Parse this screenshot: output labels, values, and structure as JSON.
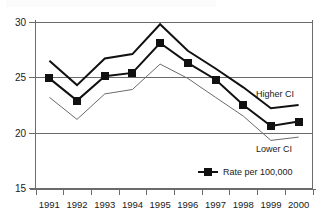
{
  "figure": {
    "top_remnant_text": "",
    "background": "#ffffff",
    "border_color": "#6b6b6b"
  },
  "annotations": {
    "higher_ci_label": "Higher CI",
    "lower_ci_label": "Lower CI"
  },
  "legend": {
    "entries": [
      {
        "label": "Rate per 100,000",
        "marker": "filled-square",
        "color": "#111111"
      }
    ]
  },
  "chart_data": {
    "type": "line",
    "title": "",
    "subtitle": "",
    "xlabel": "",
    "ylabel": "",
    "x": [
      1991,
      1992,
      1993,
      1994,
      1995,
      1996,
      1997,
      1998,
      1999,
      2000
    ],
    "categories": [
      "1991",
      "1992",
      "1993",
      "1994",
      "1995",
      "1996",
      "1997",
      "1998",
      "1999",
      "2000"
    ],
    "xtick_labels": [
      "1991",
      "1992",
      "1993",
      "1994",
      "1995",
      "1996",
      "1997",
      "1998",
      "1999",
      "2000"
    ],
    "ytick_labels": [
      "15",
      "20",
      "25",
      "30"
    ],
    "yticks": [
      15,
      20,
      25,
      30
    ],
    "ylim": [
      15,
      30
    ],
    "grid": "horizontal",
    "legend_position": "bottom-right",
    "series": [
      {
        "name": "Higher CI",
        "style": "thick-line",
        "color": "#111111",
        "marker": "none",
        "values": [
          26.5,
          24.3,
          26.7,
          27.1,
          29.8,
          27.4,
          25.8,
          24.1,
          22.2,
          22.5
        ]
      },
      {
        "name": "Rate per 100,000",
        "style": "thick-line-with-markers",
        "color": "#111111",
        "marker": "filled-square",
        "values": [
          24.9,
          22.9,
          25.1,
          25.4,
          28.1,
          26.3,
          24.8,
          22.5,
          20.6,
          21.0
        ]
      },
      {
        "name": "Lower CI",
        "style": "thin-line",
        "color": "#6b6b6b",
        "marker": "none",
        "values": [
          23.2,
          21.2,
          23.5,
          23.9,
          26.2,
          24.9,
          23.2,
          21.5,
          19.3,
          19.6
        ]
      }
    ]
  }
}
